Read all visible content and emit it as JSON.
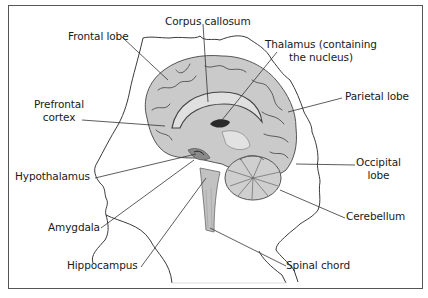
{
  "diagram": {
    "labels": [
      {
        "id": "corpus-callosum",
        "text": "Corpus callosum"
      },
      {
        "id": "frontal-lobe",
        "text": "Frontal lobe"
      },
      {
        "id": "thalamus",
        "line1": "Thalamus (containing",
        "line2": "the nucleus)"
      },
      {
        "id": "prefrontal-cortex",
        "line1": "Prefrontal",
        "line2": "cortex"
      },
      {
        "id": "parietal-lobe",
        "text": "Parietal lobe"
      },
      {
        "id": "hypothalamus",
        "text": "Hypothalamus"
      },
      {
        "id": "occipital-lobe",
        "line1": "Occipital",
        "line2": "lobe"
      },
      {
        "id": "amygdala",
        "text": "Amygdala"
      },
      {
        "id": "cerebellum",
        "text": "Cerebellum"
      },
      {
        "id": "hippocampus",
        "text": "Hippocampus"
      },
      {
        "id": "spinal-chord",
        "text": "Spinal chord"
      }
    ],
    "colors": {
      "frame": "#555555",
      "outline": "#3a3a3a",
      "brain_fill": "#c9c9c9",
      "brain_light": "#dcdcdc",
      "brain_dark": "#4a4a4a",
      "leader_line": "#333333"
    }
  }
}
